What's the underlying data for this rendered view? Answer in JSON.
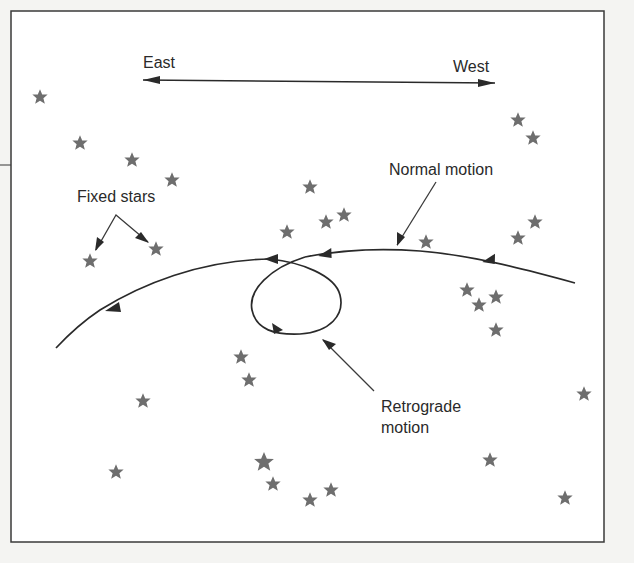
{
  "figure": {
    "direction_labels": {
      "east": "East",
      "west": "West"
    },
    "annotations": {
      "normal_motion": "Normal motion",
      "fixed_stars": "Fixed stars",
      "retrograde_line1": "Retrograde",
      "retrograde_line2": "motion"
    },
    "colors": {
      "star": "#6e6e6e",
      "line": "#2a2a2a",
      "background": "#ffffff"
    },
    "stars": [
      [
        40,
        97
      ],
      [
        80,
        143
      ],
      [
        132,
        160
      ],
      [
        172,
        180
      ],
      [
        90,
        261
      ],
      [
        156,
        249
      ],
      [
        310,
        187
      ],
      [
        287,
        232
      ],
      [
        326,
        222
      ],
      [
        344,
        215
      ],
      [
        426,
        242
      ],
      [
        518,
        120
      ],
      [
        533,
        138
      ],
      [
        518,
        238
      ],
      [
        535,
        222
      ],
      [
        467,
        290
      ],
      [
        479,
        305
      ],
      [
        496,
        297
      ],
      [
        496,
        330
      ],
      [
        241,
        357
      ],
      [
        249,
        380
      ],
      [
        143,
        401
      ],
      [
        584,
        394
      ],
      [
        116,
        472
      ],
      [
        264,
        462
      ],
      [
        273,
        484
      ],
      [
        310,
        500
      ],
      [
        331,
        490
      ],
      [
        490,
        460
      ],
      [
        565,
        498
      ]
    ]
  }
}
